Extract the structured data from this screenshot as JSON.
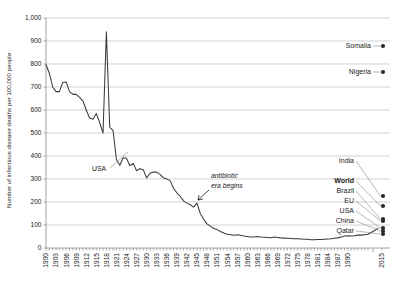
{
  "chart_data": {
    "type": "line",
    "title": "",
    "xlabel": "",
    "ylabel": "Number of infectious disease deaths per 100,000 people",
    "ylim": [
      0,
      1000
    ],
    "ytick_labels": [
      "0",
      "100",
      "200",
      "300",
      "400",
      "500",
      "600",
      "700",
      "800",
      "900",
      "1,000"
    ],
    "ytick_values": [
      0,
      100,
      200,
      300,
      400,
      500,
      600,
      700,
      800,
      900,
      1000
    ],
    "xtick_labels": [
      "1900",
      "1903",
      "1906",
      "1909",
      "1912",
      "1915",
      "1918",
      "1921",
      "1924",
      "1927",
      "1930",
      "1933",
      "1936",
      "1939",
      "1942",
      "1945",
      "1948",
      "1951",
      "1954",
      "1957",
      "1960",
      "1963",
      "1966",
      "1969",
      "1972",
      "1975",
      "1978",
      "1981",
      "1984",
      "1987",
      "1990",
      "2015"
    ],
    "grid": true,
    "legend_position": "none",
    "series": [
      {
        "name": "USA",
        "x": [
          1900,
          1901,
          1902,
          1903,
          1904,
          1905,
          1906,
          1907,
          1908,
          1909,
          1910,
          1911,
          1912,
          1913,
          1914,
          1915,
          1916,
          1917,
          1918,
          1919,
          1920,
          1921,
          1922,
          1923,
          1924,
          1925,
          1926,
          1927,
          1928,
          1929,
          1930,
          1931,
          1932,
          1933,
          1934,
          1935,
          1936,
          1937,
          1938,
          1939,
          1940,
          1941,
          1942,
          1943,
          1944,
          1945,
          1946,
          1947,
          1948,
          1949,
          1950,
          1951,
          1952,
          1953,
          1954,
          1955,
          1956,
          1957,
          1958,
          1959,
          1960,
          1961,
          1962,
          1963,
          1964,
          1965,
          1966,
          1967,
          1968,
          1969,
          1970,
          1971,
          1972,
          1973,
          1974,
          1975,
          1976,
          1977,
          1978,
          1979,
          1980,
          1981,
          1982,
          1983,
          1984,
          1985,
          1986,
          1987,
          1988,
          1989,
          1990,
          1991,
          1992,
          1993,
          1994,
          1995,
          1996
        ],
        "values": [
          797,
          760,
          700,
          680,
          680,
          720,
          722,
          680,
          668,
          668,
          655,
          640,
          600,
          565,
          560,
          585,
          545,
          500,
          940,
          525,
          510,
          385,
          360,
          392,
          390,
          358,
          368,
          336,
          345,
          340,
          305,
          325,
          330,
          330,
          320,
          305,
          300,
          293,
          260,
          240,
          225,
          205,
          195,
          188,
          178,
          195,
          150,
          125,
          105,
          95,
          85,
          80,
          72,
          65,
          60,
          58,
          55,
          58,
          55,
          52,
          50,
          48,
          48,
          50,
          48,
          47,
          46,
          45,
          48,
          46,
          44,
          43,
          42,
          41,
          40,
          40,
          39,
          38,
          38,
          36,
          36,
          37,
          37,
          38,
          39,
          40,
          42,
          44,
          48,
          52,
          53,
          52,
          53,
          56,
          56,
          58,
          60
        ]
      }
    ],
    "annotations": [
      {
        "label": "USA",
        "style": "normal"
      },
      {
        "label": "antibiotic era begins",
        "line1": "antibiotic",
        "line2": "era begins",
        "style": "italic"
      }
    ],
    "endpoint_markers": [
      {
        "label": "Somalia",
        "bold": false,
        "value_approx": 1250
      },
      {
        "label": "Nigeria",
        "bold": false,
        "value_approx": 1050
      },
      {
        "label": "India",
        "bold": false,
        "value_approx": 230
      },
      {
        "label": "World",
        "bold": true,
        "value_approx": 180
      },
      {
        "label": "Brazil",
        "bold": false,
        "value_approx": 125
      },
      {
        "label": "EU",
        "bold": false,
        "value_approx": 110
      },
      {
        "label": "USA",
        "bold": false,
        "value_approx": 85
      },
      {
        "label": "China",
        "bold": false,
        "value_approx": 70
      },
      {
        "label": "Qatar",
        "bold": false,
        "value_approx": 40
      }
    ],
    "colors": {
      "line": "#3b3b3b",
      "grid": "#bfbfbf",
      "axis": "#8a8a8a",
      "marker": "#2b2b2b",
      "background": "#ffffff"
    }
  }
}
